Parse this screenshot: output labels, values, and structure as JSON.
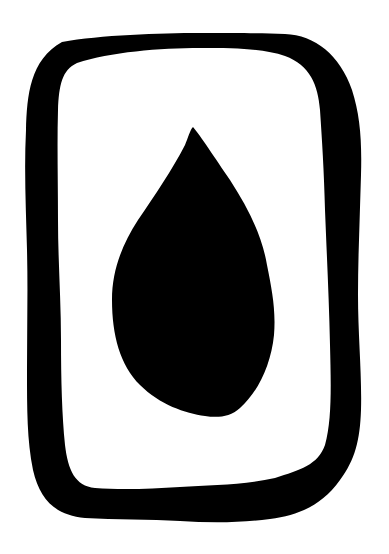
{
  "image": {
    "title": "Drop in frame icon",
    "background_color": "#ffffff",
    "ink_color": "#000000"
  },
  "icon": {
    "semantic": "water-drop-in-card-icon",
    "frame": {
      "shape": "hand-drawn rounded rectangle",
      "fill": "#000000",
      "inner_fill": "#ffffff"
    },
    "drop": {
      "shape": "teardrop",
      "fill": "#000000"
    }
  }
}
